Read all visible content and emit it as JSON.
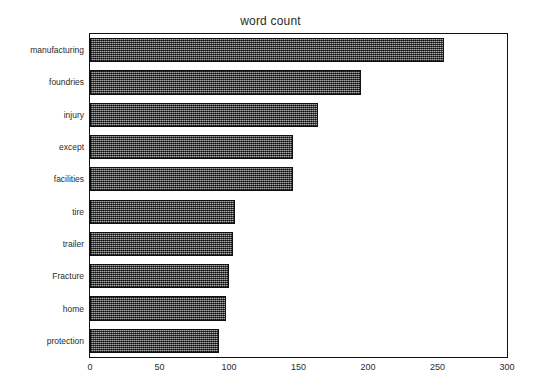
{
  "chart_data": {
    "type": "bar",
    "orientation": "horizontal",
    "title": "word count",
    "xlabel": "",
    "ylabel": "",
    "xlim": [
      0,
      300
    ],
    "ylim": null,
    "grid": false,
    "legend": null,
    "xticks": [
      0,
      50,
      100,
      150,
      200,
      250,
      300
    ],
    "xtick_labels": [
      "0",
      "50",
      "100",
      "150",
      "200",
      "250",
      "300"
    ],
    "categories": [
      "manufacturing",
      "foundries",
      "injury",
      "except",
      "facilities",
      "tire",
      "trailer",
      "Fracture",
      "home",
      "protection"
    ],
    "values": [
      255,
      195,
      164,
      146,
      146,
      104,
      103,
      100,
      98,
      93
    ],
    "bar_color": "#4a4a4a",
    "bar_edge_color": "#101010",
    "bar_fill_pattern": "dither-checkerboard",
    "axis_color": "#111111",
    "background_color": "#ffffff"
  }
}
